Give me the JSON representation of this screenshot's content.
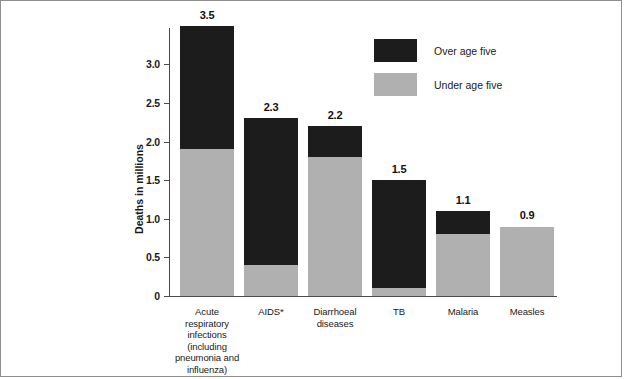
{
  "chart_data": {
    "type": "bar",
    "subtype": "stacked-vertical",
    "title": "",
    "xlabel": "",
    "ylabel": "Deaths in millions",
    "ylim": [
      0,
      3.47
    ],
    "yticks": [
      0,
      0.5,
      1.0,
      1.5,
      2.0,
      2.5,
      3.0
    ],
    "ytick_labels": [
      "0",
      "0.5",
      "1.0",
      "1.5",
      "2.0",
      "2.5",
      "3.0"
    ],
    "grid": false,
    "legend_position": "top-right",
    "categories": [
      "Acute respiratory infections (including pneumonia and influenza)",
      "AIDS*",
      "Diarrhoeal diseases",
      "TB",
      "Malaria",
      "Measles"
    ],
    "category_labels": [
      [
        "Acute",
        "respiratory",
        "infections",
        "(including",
        "pneumonia and",
        "influenza)"
      ],
      [
        "AIDS*"
      ],
      [
        "Diarrhoeal",
        "diseases"
      ],
      [
        "TB"
      ],
      [
        "Malaria"
      ],
      [
        "Measles"
      ]
    ],
    "series": [
      {
        "name": "Under age five",
        "color": "#b0b0b0",
        "values": [
          1.9,
          0.4,
          1.8,
          0.1,
          0.8,
          0.9
        ]
      },
      {
        "name": "Over age five",
        "color": "#1c1c1c",
        "values": [
          1.6,
          1.9,
          0.4,
          1.4,
          0.3,
          0.0
        ]
      }
    ],
    "totals": [
      3.5,
      2.3,
      2.2,
      1.5,
      1.1,
      0.9
    ],
    "total_labels": [
      "3.5",
      "2.3",
      "2.2",
      "1.5",
      "1.1",
      "0.9"
    ]
  },
  "legend": {
    "items": [
      {
        "label": "Over age five",
        "key": "over"
      },
      {
        "label": "Under age five",
        "key": "under"
      }
    ]
  },
  "colors": {
    "over_age_five": "#1c1c1c",
    "under_age_five": "#b0b0b0",
    "axis": "#4a4a4a",
    "border": "#8e8e8e",
    "background": "#ffffff"
  }
}
